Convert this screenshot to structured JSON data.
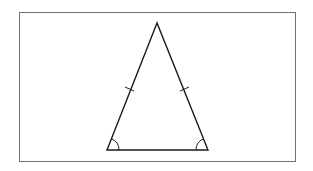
{
  "figure": {
    "type": "isosceles-triangle",
    "frame": {
      "x": 19.5,
      "y": 12.5,
      "width": 276,
      "height": 149,
      "stroke": "#707070"
    },
    "stroke_color": "#1a1a1a",
    "vertices": {
      "apex": {
        "x": 157,
        "y": 23
      },
      "base_left": {
        "x": 107,
        "y": 150
      },
      "base_right": {
        "x": 208,
        "y": 150
      }
    },
    "equal_side_marks": [
      {
        "side": "left",
        "x": 130,
        "y": 89
      },
      {
        "side": "right",
        "x": 184,
        "y": 89
      }
    ],
    "equal_angle_marks": [
      "base_left",
      "base_right"
    ]
  }
}
